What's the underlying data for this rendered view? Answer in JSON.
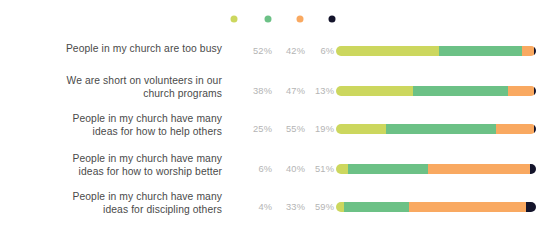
{
  "chart_data": {
    "type": "bar",
    "subtype": "stacked-horizontal-100",
    "title": "",
    "xlabel": "",
    "ylabel": "",
    "grid": false,
    "legend_position": "top",
    "xlim": [
      0,
      100
    ],
    "value_suffix": "%",
    "categories": [
      "People in my church are too busy",
      "We are short on volunteers in our\nchurch programs",
      "People in my church have many\nideas for how to help others",
      "People in my church have many\nideas for how to worship better",
      "People in my church have many\nideas for discipling others"
    ],
    "series": [
      {
        "name": "series-1",
        "color": "#ccd75e",
        "values": [
          52,
          38,
          25,
          6,
          4
        ]
      },
      {
        "name": "series-2",
        "color": "#6cc186",
        "values": [
          42,
          47,
          55,
          40,
          33
        ]
      },
      {
        "name": "series-3",
        "color": "#f9a961",
        "values": [
          6,
          13,
          19,
          51,
          59
        ]
      },
      {
        "name": "series-4",
        "color": "#14142b",
        "values": [
          1,
          1,
          1,
          3,
          5
        ]
      }
    ],
    "value_labels": [
      [
        "52%",
        "42%",
        "6%",
        "1%"
      ],
      [
        "38%",
        "47%",
        "13%",
        "1%"
      ],
      [
        "25%",
        "55%",
        "19%",
        "1%"
      ],
      [
        "6%",
        "40%",
        "51%",
        "3%"
      ],
      [
        "4%",
        "33%",
        "59%",
        "5%"
      ]
    ],
    "legend": [
      {
        "label": "",
        "color": "#ccd75e"
      },
      {
        "label": "",
        "color": "#6cc186"
      },
      {
        "label": "",
        "color": "#f9a961"
      },
      {
        "label": "",
        "color": "#14142b"
      }
    ]
  },
  "layout": {
    "row_y": [
      38,
      70,
      108,
      148,
      186
    ],
    "row_height": 34,
    "label_top": [
      4,
      4,
      4,
      4,
      4
    ],
    "pct_x": [
      248,
      281,
      310,
      332
    ],
    "pct_top": 8,
    "bar_left": 336,
    "bar_width": 200,
    "bar_top": 8,
    "legend_x": [
      234,
      268,
      300,
      332
    ],
    "background": "#ffffff",
    "label_color": "#4a4a4a",
    "pct_color": "#b4b4b4"
  }
}
